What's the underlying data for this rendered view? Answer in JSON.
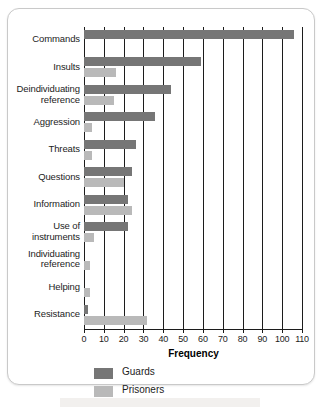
{
  "chart_data": {
    "type": "bar",
    "orientation": "horizontal",
    "title": "",
    "xlabel": "Frequency",
    "ylabel": "",
    "xlim": [
      0,
      110
    ],
    "xticks": [
      0,
      10,
      20,
      30,
      40,
      50,
      60,
      70,
      80,
      90,
      100,
      110
    ],
    "grid": true,
    "grid_axis": "x",
    "legend_position": "bottom-left",
    "categories": [
      "Commands",
      "Insults",
      "Deindividuating reference",
      "Aggression",
      "Threats",
      "Questions",
      "Information",
      "Use of instruments",
      "Individuating reference",
      "Helping",
      "Resistance"
    ],
    "category_label_lines": [
      [
        "Commands"
      ],
      [
        "Insults"
      ],
      [
        "Deindividuating",
        "reference"
      ],
      [
        "Aggression"
      ],
      [
        "Threats"
      ],
      [
        "Questions"
      ],
      [
        "Information"
      ],
      [
        "Use of",
        "instruments"
      ],
      [
        "Individuating",
        "reference"
      ],
      [
        "Helping"
      ],
      [
        "Resistance"
      ]
    ],
    "series": [
      {
        "name": "Guards",
        "color": "#767676",
        "values": [
          106,
          59,
          44,
          36,
          26,
          24,
          22,
          22,
          0,
          0,
          2
        ]
      },
      {
        "name": "Prisoners",
        "color": "#b9b9b9",
        "values": [
          0,
          16,
          15,
          4,
          4,
          20,
          24,
          5,
          3,
          3,
          32
        ]
      }
    ]
  },
  "legend": {
    "items": [
      {
        "label": "Guards",
        "swatch": "guards"
      },
      {
        "label": "Prisoners",
        "swatch": "prisoners"
      }
    ]
  },
  "axis": {
    "x_title": "Frequency"
  },
  "colors": {
    "guards": "#767676",
    "prisoners": "#b9b9b9",
    "axis": "#1c1c1c",
    "frame": "#c9c9c9",
    "background": "#ffffff"
  }
}
